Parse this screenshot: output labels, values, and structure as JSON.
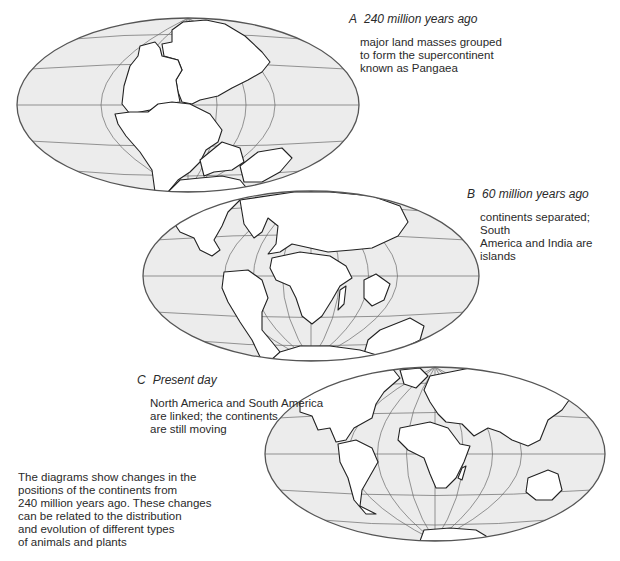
{
  "diagrams": [
    {
      "letter": "A",
      "title": "240 million years ago",
      "description_lines": [
        "major land masses grouped",
        "to form the supercontinent",
        "known as Pangaea"
      ]
    },
    {
      "letter": "B",
      "title": "60 million years ago",
      "description_lines": [
        "continents separated; South",
        "America and India are islands"
      ]
    },
    {
      "letter": "C",
      "title": "Present day",
      "description_lines": [
        "North America and South America",
        "are linked; the continents",
        "are still moving"
      ]
    }
  ],
  "caption_lines": [
    "The diagrams show changes in the",
    "positions of the continents from",
    "240 million years ago. These changes",
    "can be related to the distribution",
    "and evolution of different types",
    "of animals and plants"
  ],
  "colors": {
    "ocean": "#ececec",
    "land": "#ffffff",
    "outline": "#222222",
    "grid": "#6a6a6a"
  }
}
